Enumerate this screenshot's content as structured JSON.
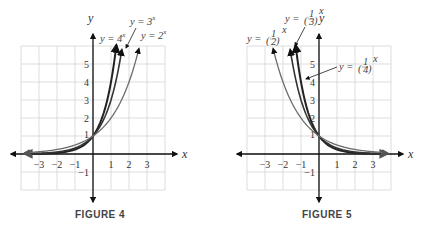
{
  "chart_data": [
    {
      "type": "line",
      "caption": "FIGURE 4",
      "xlabel": "x",
      "ylabel": "y",
      "xlim": [
        -4,
        4
      ],
      "ylim": [
        -2,
        6
      ],
      "grid": true,
      "xticks": [
        -3,
        -2,
        -1,
        1,
        2,
        3
      ],
      "xtick_labels": [
        "−3",
        "−2",
        "−1",
        "1",
        "2",
        "3"
      ],
      "yticks": [
        -1,
        1,
        2,
        3,
        4,
        5
      ],
      "ytick_labels": [
        "−1",
        "1",
        "2",
        "3",
        "4",
        "5"
      ],
      "series": [
        {
          "name": "y = 4^x",
          "label_main": "y = 4",
          "label_exp": "x",
          "base": 4,
          "x_range": [
            -3.8,
            1.3
          ],
          "color": "#222222",
          "width": 2.0
        },
        {
          "name": "y = 3^x",
          "label_main": "y = 3",
          "label_exp": "x",
          "base": 3,
          "x_range": [
            -3.8,
            1.6
          ],
          "color": "#333333",
          "width": 1.6
        },
        {
          "name": "y = 2^x",
          "label_main": "y = 2",
          "label_exp": "x",
          "base": 2,
          "x_range": [
            -3.8,
            2.55
          ],
          "color": "#6b6b6b",
          "width": 1.3
        }
      ]
    },
    {
      "type": "line",
      "caption": "FIGURE 5",
      "xlabel": "x",
      "ylabel": "y",
      "xlim": [
        -4,
        4
      ],
      "ylim": [
        -2,
        6
      ],
      "grid": true,
      "xticks": [
        -3,
        -2,
        -1,
        1,
        2,
        3
      ],
      "xtick_labels": [
        "−3",
        "−2",
        "−1",
        "1",
        "2",
        "3"
      ],
      "yticks": [
        -1,
        1,
        2,
        3,
        4,
        5
      ],
      "ytick_labels": [
        "−1",
        "1",
        "2",
        "3",
        "4",
        "5"
      ],
      "series": [
        {
          "name": "y = (1/4)^x",
          "label_main": "y = ",
          "label_frac": [
            "1",
            "4"
          ],
          "label_exp": "x",
          "base": 0.25,
          "x_range": [
            -1.3,
            3.8
          ],
          "color": "#222222",
          "width": 2.0
        },
        {
          "name": "y = (1/3)^x",
          "label_main": "y = ",
          "label_frac": [
            "1",
            "3"
          ],
          "label_exp": "x",
          "base": 0.3333,
          "x_range": [
            -1.6,
            3.8
          ],
          "color": "#333333",
          "width": 1.6
        },
        {
          "name": "y = (1/2)^x",
          "label_main": "y = ",
          "label_frac": [
            "1",
            "2"
          ],
          "label_exp": "x",
          "base": 0.5,
          "x_range": [
            -2.55,
            3.8
          ],
          "color": "#6b6b6b",
          "width": 1.3
        }
      ]
    }
  ]
}
